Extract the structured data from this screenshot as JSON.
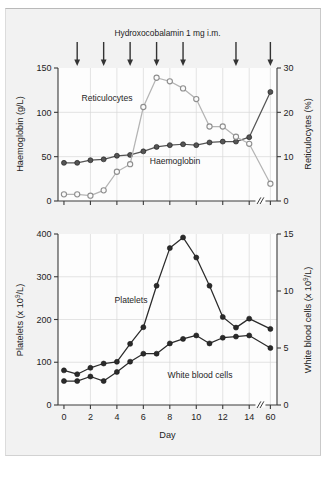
{
  "figure": {
    "annotation_title": "Hydroxocobalamin 1 mg i.m.",
    "background_color": "#f2f2f2",
    "frame_color": "#b9b9b9"
  },
  "colors": {
    "haemoglobin": "#555555",
    "reticulocytes": "#b4b4b4",
    "platelets": "#2b2b2b",
    "white_blood_cells": "#2b2b2b",
    "grid": "#d9d9d9",
    "axis": "#3a3a3a",
    "arrow": "#333333"
  },
  "arrows": {
    "name": "dose-arrow",
    "days": [
      1,
      3,
      5,
      7,
      9,
      13,
      15.6
    ],
    "count": 7
  },
  "chart_data": [
    {
      "type": "line",
      "panel": "top",
      "title": "Hydroxocobalamin 1 mg i.m.",
      "xlabel": "",
      "x": [
        0,
        1,
        2,
        3,
        4,
        5,
        6,
        7,
        8,
        9,
        10,
        11,
        12,
        13,
        14,
        15.6
      ],
      "xticklabels": [
        "0",
        "2",
        "4",
        "6",
        "8",
        "10",
        "12",
        "14",
        "60"
      ],
      "xtickvalues": [
        0,
        2,
        4,
        6,
        8,
        10,
        12,
        14,
        15.6
      ],
      "xlim": [
        -0.45,
        16.1
      ],
      "axis_break": true,
      "axis_break_position": 14.85,
      "grid": true,
      "legend": "inline-labels",
      "series": [
        {
          "name": "Haemoglobin",
          "label": "Haemoglobin",
          "axis": "left",
          "ylabel": "Haemoglobin (g/L)",
          "ylim": [
            0,
            150
          ],
          "yticks": [
            0,
            50,
            100,
            150
          ],
          "marker": "filled-circle",
          "color": "#555555",
          "values": [
            43,
            43,
            46,
            47,
            51,
            52,
            56,
            61,
            63,
            64,
            63,
            66,
            67,
            67,
            72,
            123
          ]
        },
        {
          "name": "Reticulocytes",
          "label": "Reticulocytes",
          "axis": "right",
          "ylabel": "Reticulocytes (%)",
          "ylim": [
            0,
            30
          ],
          "yticks": [
            0,
            10,
            20,
            30
          ],
          "marker": "open-circle",
          "color": "#b4b4b4",
          "values": [
            1.5,
            1.5,
            1.2,
            2.4,
            6.6,
            8.3,
            21.2,
            27.8,
            27.0,
            25.4,
            23.0,
            16.8,
            16.8,
            14.5,
            12.9,
            3.9
          ]
        }
      ]
    },
    {
      "type": "line",
      "panel": "bottom",
      "title": "",
      "xlabel": "Day",
      "x": [
        0,
        1,
        2,
        3,
        4,
        5,
        6,
        7,
        8,
        9,
        10,
        11,
        12,
        13,
        14,
        15.6
      ],
      "xticklabels": [
        "0",
        "2",
        "4",
        "6",
        "8",
        "10",
        "12",
        "14",
        "60"
      ],
      "xtickvalues": [
        0,
        2,
        4,
        6,
        8,
        10,
        12,
        14,
        15.6
      ],
      "xlim": [
        -0.45,
        16.1
      ],
      "axis_break": true,
      "axis_break_position": 14.85,
      "grid": true,
      "legend": "inline-labels",
      "series": [
        {
          "name": "Platelets",
          "label": "Platelets",
          "axis": "left",
          "ylabel": "Platelets (x 10⁹/L)",
          "ylim": [
            0,
            400
          ],
          "yticks": [
            0,
            100,
            200,
            300,
            400
          ],
          "marker": "filled-circle",
          "color": "#2b2b2b",
          "values": [
            81,
            72,
            87,
            97,
            101,
            143,
            182,
            279,
            367,
            392,
            345,
            279,
            206,
            181,
            202,
            178
          ]
        },
        {
          "name": "White blood cells",
          "label": "White blood cells",
          "axis": "right",
          "ylabel": "White blood cells (x 10⁹/L)",
          "ylim": [
            0,
            15
          ],
          "yticks": [
            0,
            5,
            10,
            15
          ],
          "marker": "filled-circle",
          "color": "#2b2b2b",
          "values": [
            2.1,
            2.1,
            2.5,
            2.1,
            2.9,
            3.8,
            4.5,
            4.5,
            5.4,
            5.8,
            6.1,
            5.4,
            5.9,
            6.0,
            6.1,
            5.0
          ]
        }
      ]
    }
  ]
}
